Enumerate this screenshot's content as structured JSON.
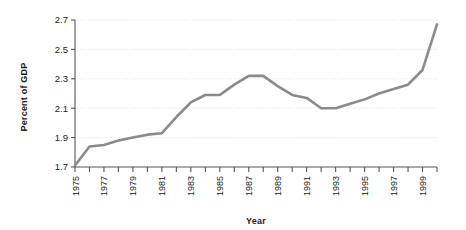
{
  "chart_data": {
    "type": "line",
    "title": "",
    "xlabel": "Year",
    "ylabel": "Percent of GDP",
    "xlim": [
      1975,
      2000
    ],
    "ylim": [
      1.7,
      2.7
    ],
    "yticks": [
      "1.7",
      "1.9",
      "2.1",
      "2.3",
      "2.5",
      "2.7"
    ],
    "ytick_values": [
      1.7,
      1.9,
      2.1,
      2.3,
      2.5,
      2.7
    ],
    "xticks": [
      "1975",
      "1977",
      "1979",
      "1981",
      "1983",
      "1985",
      "1987",
      "1989",
      "1991",
      "1993",
      "1995",
      "1997",
      "1999"
    ],
    "xtick_values": [
      1975,
      1977,
      1979,
      1981,
      1983,
      1985,
      1987,
      1989,
      1991,
      1993,
      1995,
      1997,
      1999
    ],
    "minor_xtick_values": [
      1976,
      1978,
      1980,
      1982,
      1984,
      1986,
      1988,
      1990,
      1992,
      1994,
      1996,
      1998,
      2000
    ],
    "grid": true,
    "legend": "none",
    "line_color": "#8a8a8a",
    "x": [
      1975,
      1976,
      1977,
      1978,
      1979,
      1980,
      1981,
      1982,
      1983,
      1984,
      1985,
      1986,
      1987,
      1988,
      1989,
      1990,
      1991,
      1992,
      1993,
      1994,
      1995,
      1996,
      1997,
      1998,
      1999,
      2000
    ],
    "values": [
      1.71,
      1.84,
      1.85,
      1.88,
      1.9,
      1.92,
      1.93,
      2.04,
      2.14,
      2.19,
      2.19,
      2.26,
      2.32,
      2.32,
      2.25,
      2.19,
      2.17,
      2.1,
      2.1,
      2.13,
      2.16,
      2.2,
      2.23,
      2.26,
      2.36,
      2.67
    ],
    "series": [
      {
        "name": "Percent of GDP",
        "values": [
          1.71,
          1.84,
          1.85,
          1.88,
          1.9,
          1.92,
          1.93,
          2.04,
          2.14,
          2.19,
          2.19,
          2.26,
          2.32,
          2.32,
          2.25,
          2.19,
          2.17,
          2.1,
          2.1,
          2.13,
          2.16,
          2.2,
          2.23,
          2.26,
          2.36,
          2.67
        ]
      }
    ]
  }
}
